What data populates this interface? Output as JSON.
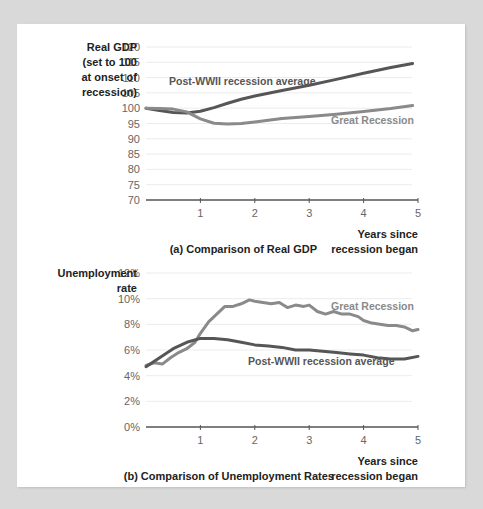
{
  "colors": {
    "background": "#d9d9d9",
    "panel": "#ffffff",
    "great_recession": "#8a8a8a",
    "post_wwii": "#565656",
    "grid": "#ececec",
    "axis": "#555555"
  },
  "chart_data": [
    {
      "type": "line",
      "title": "(a) Comparison of Real GDP",
      "ylabel_lines": [
        "Real GDP",
        "(set to 100",
        "at onset of",
        "recession)"
      ],
      "xlabel_lines": [
        "Years since",
        "recession began"
      ],
      "ylim": [
        70,
        120
      ],
      "yticks": [
        120,
        115,
        110,
        105,
        100,
        95,
        90,
        85,
        80,
        75,
        70
      ],
      "xlim": [
        0,
        5
      ],
      "xticks": [
        1,
        2,
        3,
        4,
        5
      ],
      "grid": true,
      "series": [
        {
          "name": "Post-WWII recession average",
          "x": [
            0,
            0.25,
            0.5,
            0.75,
            1.0,
            1.25,
            1.5,
            1.75,
            2.0,
            2.5,
            3.0,
            3.5,
            4.0,
            4.5,
            4.9
          ],
          "values": [
            100,
            99.2,
            98.6,
            98.4,
            99.0,
            100.2,
            101.6,
            102.9,
            104.0,
            105.8,
            107.5,
            109.4,
            111.4,
            113.3,
            114.6
          ]
        },
        {
          "name": "Great Recession",
          "x": [
            0,
            0.25,
            0.5,
            0.75,
            1.0,
            1.25,
            1.5,
            1.75,
            2.0,
            2.5,
            3.0,
            3.5,
            4.0,
            4.5,
            4.9
          ],
          "values": [
            100,
            99.9,
            99.7,
            98.8,
            96.5,
            95.1,
            94.8,
            95.0,
            95.5,
            96.6,
            97.3,
            98.0,
            98.9,
            99.9,
            100.9
          ]
        }
      ]
    },
    {
      "type": "line",
      "title": "(b) Comparison of Unemployment Rates",
      "ylabel_lines": [
        "Unemployment",
        "rate"
      ],
      "xlabel_lines": [
        "Years since",
        "recession began"
      ],
      "ylim": [
        0,
        12
      ],
      "yticks": [
        "12%",
        "10%",
        "8%",
        "6%",
        "4%",
        "2%",
        "0%"
      ],
      "xlim": [
        0,
        5
      ],
      "xticks": [
        1,
        2,
        3,
        4,
        5
      ],
      "grid": true,
      "series": [
        {
          "name": "Great Recession",
          "x": [
            0,
            0.15,
            0.3,
            0.45,
            0.6,
            0.75,
            0.9,
            1.0,
            1.15,
            1.3,
            1.45,
            1.6,
            1.75,
            1.9,
            2.0,
            2.15,
            2.3,
            2.45,
            2.6,
            2.75,
            2.9,
            3.0,
            3.15,
            3.3,
            3.45,
            3.6,
            3.75,
            3.9,
            4.0,
            4.15,
            4.3,
            4.45,
            4.6,
            4.75,
            4.9,
            5.0
          ],
          "values": [
            4.8,
            5.0,
            4.9,
            5.4,
            5.8,
            6.1,
            6.6,
            7.3,
            8.2,
            8.8,
            9.4,
            9.4,
            9.6,
            9.9,
            9.8,
            9.7,
            9.6,
            9.7,
            9.3,
            9.5,
            9.4,
            9.5,
            9.0,
            8.8,
            9.0,
            8.8,
            8.8,
            8.6,
            8.3,
            8.1,
            8.0,
            7.9,
            7.9,
            7.8,
            7.5,
            7.6
          ]
        },
        {
          "name": "Post-WWII recession average",
          "x": [
            0,
            0.25,
            0.5,
            0.75,
            1.0,
            1.25,
            1.5,
            1.75,
            2.0,
            2.25,
            2.5,
            2.75,
            3.0,
            3.25,
            3.5,
            3.75,
            4.0,
            4.25,
            4.5,
            4.75,
            5.0
          ],
          "values": [
            4.7,
            5.4,
            6.1,
            6.6,
            6.9,
            6.9,
            6.8,
            6.6,
            6.4,
            6.3,
            6.2,
            6.0,
            6.0,
            5.9,
            5.8,
            5.7,
            5.6,
            5.4,
            5.3,
            5.3,
            5.5
          ]
        }
      ]
    }
  ]
}
